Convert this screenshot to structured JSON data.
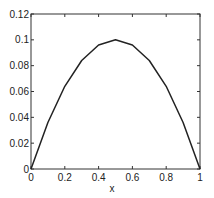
{
  "chart_data": {
    "type": "line",
    "title": "",
    "xlabel": "x",
    "ylabel": "",
    "xlim": [
      0,
      1
    ],
    "ylim": [
      0,
      0.12
    ],
    "grid": false,
    "legend": null,
    "x_ticks": [
      "0",
      "0.2",
      "0.4",
      "0.6",
      "0.8",
      "1"
    ],
    "y_ticks": [
      "0",
      "0.02",
      "0.04",
      "0.06",
      "0.08",
      "0.1",
      "0.12"
    ],
    "series": [
      {
        "name": "curve",
        "color": "#222222",
        "x": [
          0,
          0.1,
          0.2,
          0.3,
          0.4,
          0.5,
          0.6,
          0.7,
          0.8,
          0.9,
          1.0
        ],
        "y": [
          0,
          0.036,
          0.064,
          0.084,
          0.096,
          0.1,
          0.096,
          0.084,
          0.064,
          0.036,
          0
        ]
      }
    ]
  }
}
